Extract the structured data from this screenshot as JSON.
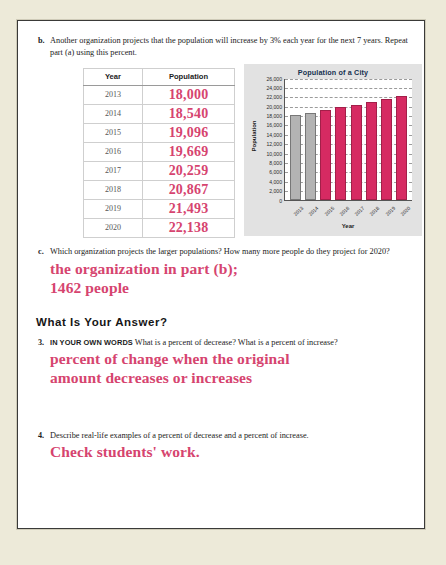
{
  "page": {
    "background_color": "#edead9",
    "sheet_color": "#ffffff",
    "answer_color": "#d6446f"
  },
  "part_b": {
    "marker": "b.",
    "text": "Another organization projects that the population will increase by 3% each year for the next 7 years. Repeat part (a) using this percent."
  },
  "table": {
    "headers": [
      "Year",
      "Population"
    ],
    "rows": [
      {
        "year": "2013",
        "population": "18,000"
      },
      {
        "year": "2014",
        "population": "18,540"
      },
      {
        "year": "2015",
        "population": "19,096"
      },
      {
        "year": "2016",
        "population": "19,669"
      },
      {
        "year": "2017",
        "population": "20,259"
      },
      {
        "year": "2018",
        "population": "20,867"
      },
      {
        "year": "2019",
        "population": "21,493"
      },
      {
        "year": "2020",
        "population": "22,138"
      }
    ]
  },
  "chart_data": {
    "type": "bar",
    "title": "Population of a City",
    "xlabel": "Year",
    "ylabel": "Population",
    "categories": [
      "2013",
      "2014",
      "2015",
      "2016",
      "2017",
      "2018",
      "2019",
      "2020"
    ],
    "values": [
      18000,
      18540,
      19096,
      19669,
      20259,
      20867,
      21493,
      22138
    ],
    "bar_colors": [
      "#b3b3b3",
      "#b3b3b3",
      "#d62a62",
      "#d62a62",
      "#d62a62",
      "#d62a62",
      "#d62a62",
      "#d62a62"
    ],
    "ylim": [
      0,
      26000
    ],
    "ytick_step": 2000,
    "yticks": [
      "26,000",
      "24,000",
      "22,000",
      "20,000",
      "18,000",
      "16,000",
      "14,000",
      "12,000",
      "10,000",
      "8,000",
      "6,000",
      "4,000",
      "2,000",
      "0"
    ],
    "grid": true,
    "legend": false
  },
  "part_c": {
    "marker": "c.",
    "text": "Which organization projects the larger populations? How many more people do they project for 2020?",
    "answer_line1": "the organization in part (b);",
    "answer_line2": "1462 people"
  },
  "section": {
    "heading": "What Is Your Answer?"
  },
  "question_3": {
    "marker": "3.",
    "lead": "IN YOUR OWN WORDS",
    "text": "What is a percent of decrease? What is a percent of increase?",
    "answer_line1": "percent of change when the original",
    "answer_line2": "amount decreases or increases"
  },
  "question_4": {
    "marker": "4.",
    "text": "Describe real-life examples of a percent of decrease and a percent of increase.",
    "answer": "Check students' work."
  }
}
